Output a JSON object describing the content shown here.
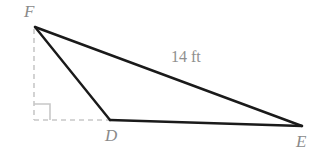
{
  "figure": {
    "type": "geometry-diagram",
    "background_color": "#ffffff",
    "width": 329,
    "height": 160,
    "solid_stroke_color": "#1a1a1a",
    "dashed_stroke_color": "#c8c8c8",
    "label_color": "#8a8a8a",
    "vertices": [
      {
        "id": "F",
        "label": "F",
        "x": 35,
        "y": 27
      },
      {
        "id": "D",
        "label": "D",
        "x": 110,
        "y": 120
      },
      {
        "id": "E",
        "label": "E",
        "x": 302,
        "y": 126
      }
    ],
    "solid_segments": [
      {
        "name": "segment-FE",
        "from": "F",
        "to": "E"
      },
      {
        "name": "segment-FD",
        "from": "F",
        "to": "D"
      },
      {
        "name": "segment-DE",
        "from": "D",
        "to": "E"
      }
    ],
    "dashed_segments": [
      {
        "name": "dashed-vertical-from-F",
        "x1": 34,
        "y1": 29,
        "x2": 34,
        "y2": 120
      },
      {
        "name": "dashed-horizontal-to-D",
        "x1": 34,
        "y1": 120,
        "x2": 110,
        "y2": 120
      }
    ],
    "right_angle_marker": {
      "name": "right-angle-marker",
      "corner_x": 34,
      "corner_y": 120,
      "size": 16
    },
    "measurements": [
      {
        "name": "side-FE-length",
        "text": "14 ft",
        "value": 14,
        "unit": "ft",
        "on_segment": "FE"
      }
    ]
  }
}
